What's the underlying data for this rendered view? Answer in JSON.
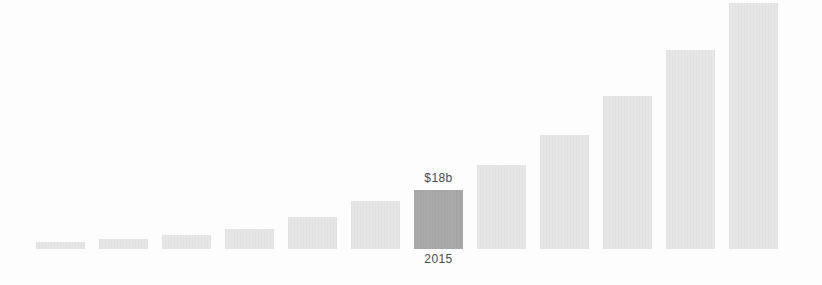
{
  "chart": {
    "colors": {
      "background": "#fdfdfd",
      "bar_default": "#e5e6e5",
      "bar_highlight": "#a9a9a9",
      "label_text": "#4a4a4a"
    }
  },
  "chart_data": {
    "type": "bar",
    "title": "",
    "xlabel": "",
    "ylabel": "",
    "axes_shown": false,
    "grid": false,
    "legend": "none",
    "categories": [
      "",
      "",
      "",
      "",
      "",
      "",
      "2015",
      "",
      "",
      "",
      "",
      ""
    ],
    "values_est_billions_usd": [
      2,
      3,
      4,
      6,
      10,
      15,
      18,
      26,
      35,
      47,
      61,
      75
    ],
    "highlight_index": 6,
    "annotations": [
      {
        "text": "$18b",
        "position": "above-highlighted-bar"
      },
      {
        "text": "2015",
        "position": "below-highlighted-bar"
      }
    ],
    "bars": [
      {
        "height_px": 7,
        "highlight": false
      },
      {
        "height_px": 10,
        "highlight": false
      },
      {
        "height_px": 14,
        "highlight": false
      },
      {
        "height_px": 20,
        "highlight": false
      },
      {
        "height_px": 32,
        "highlight": false
      },
      {
        "height_px": 48,
        "highlight": false
      },
      {
        "height_px": 59,
        "highlight": true,
        "label_above": "$18b",
        "label_below": "2015"
      },
      {
        "height_px": 84,
        "highlight": false
      },
      {
        "height_px": 114,
        "highlight": false
      },
      {
        "height_px": 153,
        "highlight": false
      },
      {
        "height_px": 199,
        "highlight": false
      },
      {
        "height_px": 246,
        "highlight": false
      }
    ]
  }
}
